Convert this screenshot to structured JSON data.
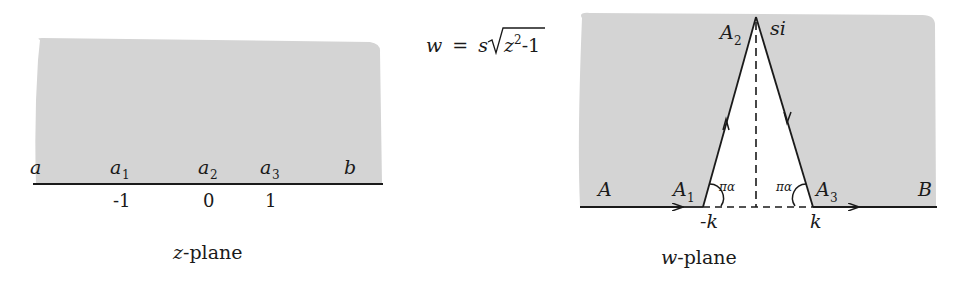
{
  "figure": {
    "type": "conformal-mapping-diagram",
    "colors": {
      "shaded_region": "#d4d4d4",
      "line": "#1a1a1a",
      "background": "#ffffff"
    }
  },
  "z_plane": {
    "caption_var": "z",
    "caption_rest": "-plane",
    "boundary_labels": {
      "a": "a",
      "a1": "a",
      "a1_sub": "1",
      "a2": "a",
      "a2_sub": "2",
      "a3": "a",
      "a3_sub": "3",
      "b": "b"
    },
    "ticks": [
      "-1",
      "0",
      "1"
    ]
  },
  "mapping": {
    "lhs": "w",
    "equals": "=",
    "coef": "s",
    "radicand_var": "z",
    "exponent": "2",
    "radicand_rest": "-1"
  },
  "w_plane": {
    "caption_var": "w",
    "caption_rest": "-plane",
    "labels": {
      "A": "A",
      "A1": "A",
      "A1_sub": "1",
      "A2": "A",
      "A2_sub": "2",
      "A3": "A",
      "A3_sub": "3",
      "B": "B",
      "apex": "si",
      "left_foot": "-k",
      "right_foot": "k",
      "angle_left": "πα",
      "angle_right": "πα"
    }
  }
}
